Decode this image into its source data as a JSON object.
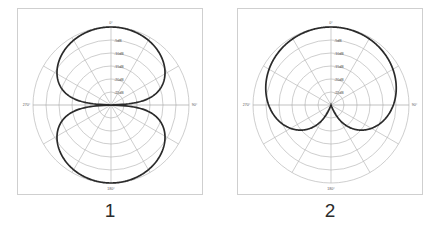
{
  "page": {
    "background_color": "#ffffff",
    "figure_count": 2
  },
  "figures": [
    {
      "caption": "1",
      "pattern_name": "bidirectional",
      "grid": {
        "rings": 6,
        "spoke_step_degrees": 30,
        "radial_labels": [
          "-5dB",
          "-10dB",
          "-15dB",
          "-20dB",
          "-25dB"
        ],
        "angle_labels": {
          "top": "0°",
          "right": "90°",
          "bottom": "180°",
          "left": "270°"
        }
      },
      "colors": {
        "curve": "#2a2a2a",
        "grid": "#b9b9b9",
        "frame": "#cfcfcf",
        "label": "#4a4a4a"
      }
    },
    {
      "caption": "2",
      "pattern_name": "cardioid",
      "grid": {
        "rings": 6,
        "spoke_step_degrees": 30,
        "radial_labels": [
          "-5dB",
          "-10dB",
          "-15dB",
          "-20dB",
          "-25dB"
        ],
        "angle_labels": {
          "top": "0°",
          "right": "90°",
          "bottom": "180°",
          "left": "270°"
        }
      },
      "colors": {
        "curve": "#2a2a2a",
        "grid": "#b9b9b9",
        "frame": "#cfcfcf",
        "label": "#4a4a4a"
      }
    }
  ],
  "chart_data": [
    {
      "type": "line",
      "plot_style": "polar",
      "title": "",
      "caption": "1",
      "pattern": "bidirectional",
      "formula": "|cos(theta)|",
      "xlabel": "",
      "ylabel": "",
      "r_unit": "dB",
      "r_min_db": -30,
      "r_max_db": 0,
      "radial_ticks_db": [
        -5,
        -10,
        -15,
        -20,
        -25
      ],
      "radial_tick_labels": [
        "-5dB",
        "-10dB",
        "-15dB",
        "-20dB",
        "-25dB"
      ],
      "angle_ticks_deg": [
        0,
        30,
        60,
        90,
        120,
        150,
        180,
        210,
        240,
        270,
        300,
        330
      ],
      "angle_tick_labels": [
        "0°",
        "90°",
        "180°",
        "270°"
      ],
      "grid": true,
      "legend": "none",
      "theta_deg": [
        0,
        15,
        30,
        45,
        60,
        75,
        90,
        105,
        120,
        135,
        150,
        165,
        180,
        195,
        210,
        225,
        240,
        255,
        270,
        285,
        300,
        315,
        330,
        345
      ],
      "response_linear": [
        1.0,
        0.966,
        0.866,
        0.707,
        0.5,
        0.259,
        0.0,
        0.259,
        0.5,
        0.707,
        0.866,
        0.966,
        1.0,
        0.966,
        0.866,
        0.707,
        0.5,
        0.259,
        0.0,
        0.259,
        0.5,
        0.707,
        0.866,
        0.966
      ],
      "response_db": [
        0.0,
        -0.3,
        -1.25,
        -3.0,
        -6.0,
        -11.7,
        -30.0,
        -11.7,
        -6.0,
        -3.0,
        -1.25,
        -0.3,
        0.0,
        -0.3,
        -1.25,
        -3.0,
        -6.0,
        -11.7,
        -30.0,
        -11.7,
        -6.0,
        -3.0,
        -1.25,
        -0.3
      ]
    },
    {
      "type": "line",
      "plot_style": "polar",
      "title": "",
      "caption": "2",
      "pattern": "cardioid",
      "formula": "0.5 + 0.5*cos(theta)",
      "xlabel": "",
      "ylabel": "",
      "r_unit": "dB",
      "r_min_db": -30,
      "r_max_db": 0,
      "radial_ticks_db": [
        -5,
        -10,
        -15,
        -20,
        -25
      ],
      "radial_tick_labels": [
        "-5dB",
        "-10dB",
        "-15dB",
        "-20dB",
        "-25dB"
      ],
      "angle_ticks_deg": [
        0,
        30,
        60,
        90,
        120,
        150,
        180,
        210,
        240,
        270,
        300,
        330
      ],
      "angle_tick_labels": [
        "0°",
        "90°",
        "180°",
        "270°"
      ],
      "grid": true,
      "legend": "none",
      "theta_deg": [
        0,
        15,
        30,
        45,
        60,
        75,
        90,
        105,
        120,
        135,
        150,
        165,
        180,
        195,
        210,
        225,
        240,
        255,
        270,
        285,
        300,
        315,
        330,
        345
      ],
      "response_linear": [
        1.0,
        0.983,
        0.933,
        0.854,
        0.75,
        0.629,
        0.5,
        0.371,
        0.25,
        0.146,
        0.067,
        0.017,
        0.0,
        0.017,
        0.067,
        0.146,
        0.25,
        0.371,
        0.5,
        0.629,
        0.75,
        0.854,
        0.933,
        0.983
      ],
      "response_db": [
        0.0,
        -0.15,
        -0.6,
        -1.37,
        -2.5,
        -4.02,
        -6.0,
        -8.6,
        -12.0,
        -16.7,
        -23.5,
        -35.4,
        -30.0,
        -35.4,
        -23.5,
        -16.7,
        -12.0,
        -8.6,
        -6.0,
        -4.02,
        -2.5,
        -1.37,
        -0.6,
        -0.15
      ]
    }
  ]
}
